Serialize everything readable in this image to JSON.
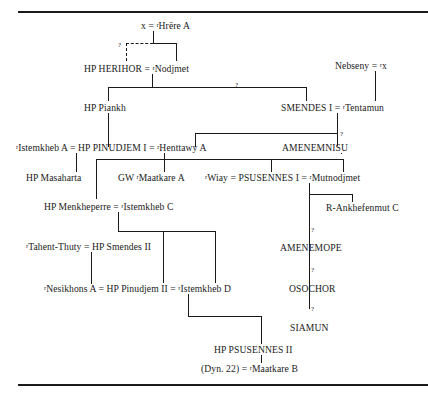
{
  "diagram": {
    "type": "genealogical-tree",
    "nodes": {
      "x_hrere": "x = ʳHrēre A",
      "herihor": "HP HERIHOR = ʳNodjmet",
      "nebseny": "Nebseny = ʳx",
      "piankh": "HP Piankh",
      "smendes1": "SMENDES I = ʳTentamun",
      "pinudjem1": "ʳIstemkheb A = HP PINUDJEM I = ʳHenttawy A",
      "amenemnisu": "AMENEMNISU",
      "masaharta": "HP Masaharta",
      "maatkare_a": "GW ʳMaatkare A",
      "psusennes1": "ʳWiay = PSUSENNES I = ʳMutnodjmet",
      "menkheperre": "HP Menkheperre = ʳIstemkheb C",
      "ankhefenmut": "R-Ankhefenmut C",
      "smendes2": "ʳTahent-Thuty = HP Smendes II",
      "amenemope": "AMENEMOPE",
      "pinudjem2": "ʳNesikhons A = HP Pinudjem II = ʳIstemkheb D",
      "osochor": "OSOCHOR",
      "siamun": "SIAMUN",
      "psusennes2": "HP PSUSENNES II",
      "maatkare_b": "(Dyn. 22) = ʳMaatkare B"
    },
    "uncertain_marks": {
      "herihor_parent": "?",
      "smendes_link": "?",
      "amenemnisu_link": "?",
      "amenemope_link": "?",
      "osochor_link": "?",
      "siamun_link": "?"
    },
    "colors": {
      "ink": "#1a1a1a",
      "background": "#ffffff"
    }
  }
}
